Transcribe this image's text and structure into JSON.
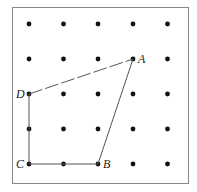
{
  "diagram": {
    "type": "geoboard-quadrilateral",
    "grid": {
      "rows": 5,
      "cols": 5,
      "x": [
        29,
        63.5,
        98,
        133,
        167.5
      ],
      "y": [
        24,
        59,
        94,
        129,
        164
      ]
    },
    "points": [
      {
        "label": "A",
        "col": 3,
        "row": 1
      },
      {
        "label": "B",
        "col": 2,
        "row": 4
      },
      {
        "label": "C",
        "col": 0,
        "row": 4
      },
      {
        "label": "D",
        "col": 0,
        "row": 2
      }
    ],
    "segments": [
      {
        "from": "A",
        "to": "B",
        "style": "solid"
      },
      {
        "from": "B",
        "to": "C",
        "style": "solid"
      },
      {
        "from": "C",
        "to": "D",
        "style": "solid"
      },
      {
        "from": "D",
        "to": "A",
        "style": "dashed"
      }
    ],
    "labels": {
      "A": "A",
      "B": "B",
      "C": "C",
      "D": "D"
    },
    "colors": {
      "dot": "#111111",
      "line": "#555555",
      "border": "#888888"
    }
  }
}
